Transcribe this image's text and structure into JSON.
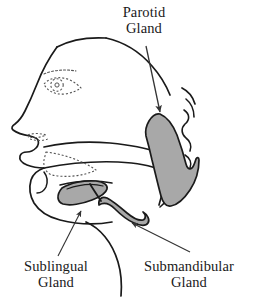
{
  "figure": {
    "background_color": "#ffffff",
    "outline_color": "#1a1a1a",
    "gland_fill_color": "#a8a8a8",
    "dotted_color": "#555555",
    "arrow_color": "#333333",
    "label_color": "#1a1a1a"
  },
  "labels": {
    "parotid": {
      "line1": "Parotid",
      "line2": "Gland",
      "full": "Parotid Gland"
    },
    "sublingual": {
      "line1": "Sublingual",
      "line2": "Gland",
      "full": "Sublingual Gland"
    },
    "submandibular": {
      "line1": "Submandibular",
      "line2": "Gland",
      "full": "Submandibular Gland"
    }
  },
  "structures": [
    {
      "name": "head-profile",
      "kind": "outline",
      "shaded": false
    },
    {
      "name": "eye",
      "kind": "dotted-detail",
      "shaded": false
    },
    {
      "name": "eyebrow",
      "kind": "dotted-detail",
      "shaded": false
    },
    {
      "name": "lips",
      "kind": "dotted-detail",
      "shaded": false
    },
    {
      "name": "ear",
      "kind": "outline",
      "shaded": false
    },
    {
      "name": "mandible",
      "kind": "outline",
      "shaded": false
    },
    {
      "name": "tongue",
      "kind": "dotted-detail",
      "shaded": false
    },
    {
      "name": "parotid-gland",
      "kind": "gland",
      "shaded": true
    },
    {
      "name": "sublingual-gland",
      "kind": "gland",
      "shaded": true
    },
    {
      "name": "submandibular-gland",
      "kind": "gland",
      "shaded": true
    },
    {
      "name": "submandibular-duct",
      "kind": "outline",
      "shaded": false
    },
    {
      "name": "neck-contour",
      "kind": "outline",
      "shaded": false
    }
  ],
  "pointers": [
    {
      "name": "parotid",
      "from": [
        146,
        46
      ],
      "to": [
        160,
        114
      ]
    },
    {
      "name": "sublingual",
      "from": [
        58,
        256
      ],
      "to": [
        80,
        212
      ]
    },
    {
      "name": "submandibular",
      "from": [
        190,
        252
      ],
      "to": [
        131,
        222
      ]
    }
  ]
}
